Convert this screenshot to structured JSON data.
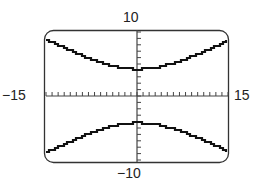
{
  "chart_data": {
    "type": "line",
    "title": "",
    "xlabel": "",
    "ylabel": "",
    "xlim": [
      -15,
      15
    ],
    "ylim": [
      -10,
      10
    ],
    "x_tick_interval": 1,
    "y_tick_interval": 1,
    "grid": false,
    "window_labels": {
      "xmin": "−15",
      "xmax": "15",
      "ymin": "−10",
      "ymax": "10"
    },
    "series": [
      {
        "name": "upper branch",
        "x": [
          -15,
          -12,
          -9,
          -6,
          -3,
          0,
          3,
          6,
          9,
          12,
          15
        ],
        "y": [
          8.75,
          7.6,
          6.6,
          5.6,
          4.6,
          4.2,
          4.6,
          5.6,
          6.6,
          7.6,
          8.75
        ]
      },
      {
        "name": "lower branch",
        "x": [
          -15,
          -12,
          -9,
          -6,
          -3,
          0,
          3,
          6,
          9,
          12,
          15
        ],
        "y": [
          -8.75,
          -7.6,
          -6.6,
          -5.6,
          -4.6,
          -4.2,
          -4.6,
          -5.6,
          -6.6,
          -7.6,
          -8.75
        ]
      }
    ],
    "colors": {
      "curve": "#111111",
      "frame": "#333333",
      "axes": "#444444"
    }
  }
}
